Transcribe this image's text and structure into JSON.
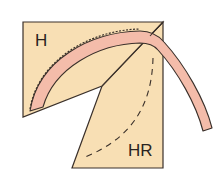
{
  "diagram": {
    "labels": {
      "piece_h": "H",
      "piece_hr": "HR"
    },
    "colors": {
      "background_piece": "#f8dfb4",
      "bias_strip": "#f4bcaa",
      "outline": "#3a302a",
      "page": "#ffffff"
    },
    "elements": [
      {
        "name": "piece-h",
        "label": "H",
        "shape": "polygon"
      },
      {
        "name": "piece-hr",
        "label": "HR",
        "shape": "polygon"
      },
      {
        "name": "bias-strip",
        "shape": "curved band"
      },
      {
        "name": "placement-line",
        "style": "dashed curve"
      },
      {
        "name": "stitch-line",
        "style": "hand stitches along outer edge"
      }
    ]
  }
}
